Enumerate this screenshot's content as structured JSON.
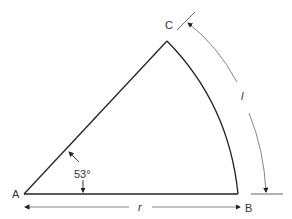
{
  "diagram": {
    "type": "circular-sector",
    "points": {
      "a": "A",
      "b": "B",
      "c": "C"
    },
    "angle_label": "53°",
    "angle_degrees": 53,
    "radius_label": "r",
    "arc_length_label": "l",
    "colors": {
      "shape": "#222222",
      "dimension": "#555555"
    }
  }
}
